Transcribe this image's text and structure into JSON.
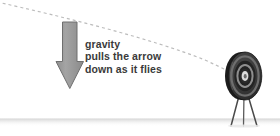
{
  "diagram": {
    "title": "Gravity pulls the arrow down as it flies",
    "background_color": "#ffffff",
    "caption": {
      "lines": [
        "gravity",
        "pulls the arrow",
        "down as it flies"
      ],
      "text_color": "#3a3a3a"
    },
    "gravity_arrow": {
      "name": "gravity-arrow",
      "direction": "down",
      "fill_color": "#9b9b9b",
      "outline_color": "#6e6e6e",
      "shaft_top_y": 22,
      "tip_y": 89
    },
    "trajectory": {
      "name": "arrow-flight-path",
      "style": "dashed",
      "dash_color": "#b9b9b9",
      "dash_pattern": "3 3",
      "start_point": [
        0,
        3
      ],
      "end_point": [
        240,
        77
      ],
      "description": "descending parabolic arc from upper left to target center"
    },
    "target": {
      "name": "archery-target",
      "center": [
        245,
        76
      ],
      "radius_x": 17,
      "radius_y": 24,
      "ring_colors": [
        "#2f2f2f",
        "#6a6a6a",
        "#1f1f1f",
        "#8c8c8c",
        "#d8d8d8",
        "#8c8c8c"
      ],
      "stand": {
        "name": "target-tripod-stand",
        "leg_color": "#4a4a4a",
        "leg_count": 3
      }
    },
    "ground": {
      "name": "ground-line",
      "y": 126,
      "line_color": "#8e8e8e",
      "shadow_color": "#e2e2e2"
    }
  }
}
